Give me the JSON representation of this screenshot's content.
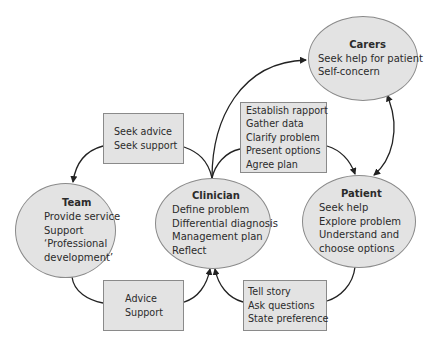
{
  "nodes": {
    "carers": {
      "title": "Carers",
      "lines": [
        "Seek help for patient",
        "Self-concern"
      ]
    },
    "team": {
      "title": "Team",
      "lines": [
        "Provide service",
        "Support",
        "‘Professional",
        "development’"
      ]
    },
    "clinician": {
      "title": "Clinician",
      "lines": [
        "Define problem",
        "Differential diagnosis",
        "Management plan",
        "Reflect"
      ]
    },
    "patient": {
      "title": "Patient",
      "lines": [
        "Seek help",
        "Explore problem",
        "Understand and",
        "choose options"
      ]
    }
  },
  "boxes": {
    "clinician_to_team": {
      "lines": [
        "Seek advice",
        "Seek support"
      ]
    },
    "clinician_to_patient": {
      "lines": [
        "Establish rapport",
        "Gather data",
        "Clarify problem",
        "Present options",
        "Agree plan"
      ]
    },
    "team_to_clinician": {
      "lines": [
        "Advice",
        "Support"
      ]
    },
    "patient_to_clinician": {
      "lines": [
        "Tell story",
        "Ask questions",
        "State preference"
      ]
    }
  },
  "colors": {
    "shape_fill": "#e3e3e3",
    "shape_border": "#8a8a8a",
    "arrow": "#222222",
    "text": "#2b2b2b"
  }
}
